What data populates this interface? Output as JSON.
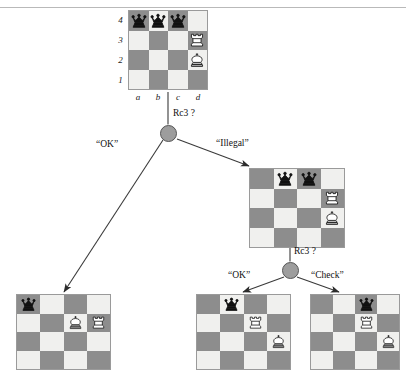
{
  "figure": {
    "type": "game-tree-diagram"
  },
  "board_geometry": {
    "files": [
      "a",
      "b",
      "c",
      "d"
    ],
    "ranks": [
      "4",
      "3",
      "2",
      "1"
    ]
  },
  "glyphs": {
    "black_queen": "black-queen",
    "white_rook": "white-rook",
    "white_king": "white-king"
  },
  "colors": {
    "dark_square": "#8d8d8d",
    "light_square": "#f0f0ee",
    "board_border": "#9a9a9a",
    "node_fill": "#9d9d9d",
    "node_stroke": "#555555",
    "edge": "#3a3a3a",
    "rule": "#b9b9b9",
    "text": "#111111"
  },
  "boards": {
    "root": {
      "name": "root-position",
      "show_coordinates": true,
      "pieces": [
        {
          "square": "a4",
          "piece": "black-queen"
        },
        {
          "square": "b4",
          "piece": "black-queen"
        },
        {
          "square": "c4",
          "piece": "black-queen"
        },
        {
          "square": "d3",
          "piece": "white-rook"
        },
        {
          "square": "d2",
          "piece": "white-king"
        }
      ]
    },
    "illegal_branch": {
      "name": "illegal-branch-position",
      "show_coordinates": false,
      "pieces": [
        {
          "square": "b4",
          "piece": "black-queen"
        },
        {
          "square": "c4",
          "piece": "black-queen"
        },
        {
          "square": "d3",
          "piece": "white-rook"
        },
        {
          "square": "d2",
          "piece": "white-king"
        }
      ]
    },
    "ok_leaf": {
      "name": "ok-leaf-position",
      "show_coordinates": false,
      "pieces": [
        {
          "square": "a4",
          "piece": "black-queen"
        },
        {
          "square": "c3",
          "piece": "white-king"
        },
        {
          "square": "d3",
          "piece": "white-rook"
        }
      ]
    },
    "ok_leaf_2": {
      "name": "ok-leaf-2-position",
      "show_coordinates": false,
      "pieces": [
        {
          "square": "b4",
          "piece": "black-queen"
        },
        {
          "square": "c3",
          "piece": "white-rook"
        },
        {
          "square": "d2",
          "piece": "white-king"
        }
      ]
    },
    "check_leaf": {
      "name": "check-leaf-position",
      "show_coordinates": false,
      "pieces": [
        {
          "square": "c4",
          "piece": "black-queen"
        },
        {
          "square": "c3",
          "piece": "white-rook"
        },
        {
          "square": "d2",
          "piece": "white-king"
        }
      ]
    }
  },
  "labels": {
    "root_move": "Rc3 ?",
    "second_move": "Rc3 ?",
    "root_ok": "“OK”",
    "root_illegal": "“Illegal”",
    "second_ok": "“OK”",
    "second_check": "“Check”"
  }
}
